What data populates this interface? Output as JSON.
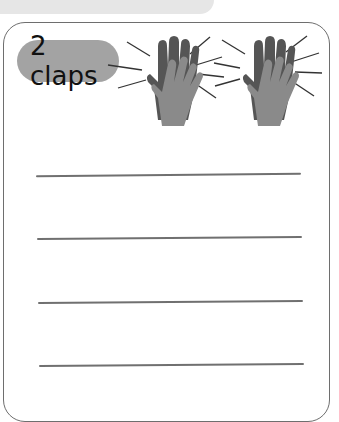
{
  "header_band": {
    "color": "#e6e6e6"
  },
  "card": {
    "label": "2 claps",
    "label_bg": "#a3a3a3",
    "border_color": "#6e6e6e",
    "icons": [
      "clapping-hands-icon",
      "clapping-hands-icon"
    ],
    "writing_lines": 4
  }
}
